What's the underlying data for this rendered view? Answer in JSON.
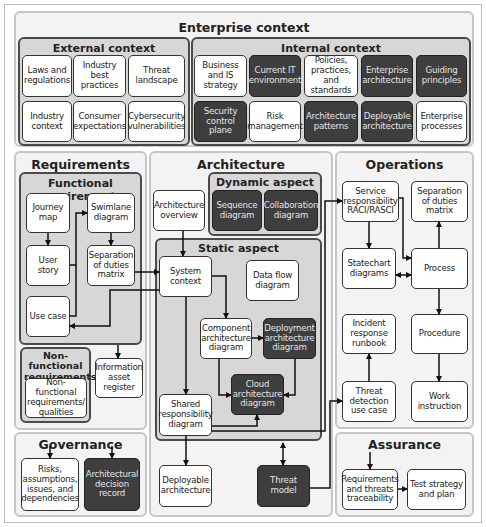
{
  "enterprise_context": {
    "title": "Enterprise context",
    "external": {
      "title": "External context",
      "items": [
        "Laws and regulations",
        "Industry best practices",
        "Threat landscape",
        "Industry context",
        "Consumer expectations",
        "Cybersecurity vulnerabilities"
      ]
    },
    "internal": {
      "title": "Internal context",
      "items": [
        "Business and IS strategy",
        "Current IT environment",
        "Policies, practices, and standards",
        "Enterprise architecture",
        "Guiding principles",
        "Security control plane",
        "Risk management",
        "Architecture patterns",
        "Deployable architecture",
        "Enterprise processes"
      ]
    }
  },
  "requirements": {
    "title": "Requirements",
    "functional": {
      "title": "Functional requirements",
      "items": [
        "Journey map",
        "User story",
        "Use case",
        "Swimlane diagram",
        "Separation of duties matrix"
      ]
    },
    "non_functional": {
      "title": "Non-functional requirements",
      "items": [
        "Non-functional requirements/ qualities"
      ]
    },
    "information_asset_register": "Information asset register"
  },
  "governance": {
    "title": "Governance",
    "items": [
      "Risks, assumptions, issues, and dependencies",
      "Architectural decision record"
    ]
  },
  "architecture": {
    "title": "Architecture",
    "overview": "Architecture overview",
    "dynamic": {
      "title": "Dynamic aspect",
      "items": [
        "Sequence diagram",
        "Collaboration diagram"
      ]
    },
    "static": {
      "title": "Static aspect",
      "items": [
        "System context",
        "Data flow diagram",
        "Component architecture diagram",
        "Deployment architecture diagram",
        "Cloud architecture diagram",
        "Shared responsibility diagram"
      ]
    },
    "deployable_architecture": "Deployable architecture",
    "threat_model": "Threat model"
  },
  "operations": {
    "title": "Operations",
    "items": [
      "Service responsibility RACI/RASCI",
      "Separation of duties matrix",
      "Statechart diagrams",
      "Process",
      "Incident response runbook",
      "Procedure",
      "Threat detection use case",
      "Work instruction"
    ]
  },
  "assurance": {
    "title": "Assurance",
    "items": [
      "Requirements and threats traceability",
      "Test strategy and plan"
    ]
  },
  "colors": {
    "dark_box": "#3e3e3e",
    "light_box": "#ffffff",
    "group_fill": "#d7d7d7",
    "panel_fill": "#f3f3f3",
    "arrow": "#111111"
  }
}
